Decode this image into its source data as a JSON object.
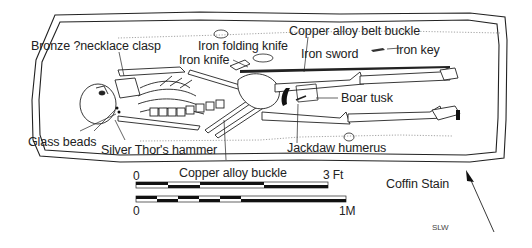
{
  "figure": {
    "type": "archaeological grave plan",
    "signature": "SLW"
  },
  "labels": {
    "bronze_clasp": "Bronze ?necklace clasp",
    "iron_folding_knife": "Iron folding knife",
    "iron_knife": "Iron knife",
    "copper_belt_buckle": "Copper alloy belt buckle",
    "iron_sword": "Iron sword",
    "iron_key": "Iron key",
    "boar_tusk": "Boar tusk",
    "jackdaw_humerus": "Jackdaw humerus",
    "glass_beads": "Glass beads",
    "thors_hammer": "Silver Thor's hammer",
    "copper_buckle": "Copper alloy buckle"
  },
  "legend": {
    "coffin_stain": "Coffin Stain"
  },
  "scale_bars": {
    "feet": {
      "start": "0",
      "end": "3 Ft",
      "segments": 6
    },
    "metric": {
      "start": "0",
      "end": "1M",
      "segments": 6
    }
  },
  "north_arrow": {
    "icon": "north-arrow-icon"
  },
  "colors": {
    "ink": "#222222",
    "stain": "#9a9a9a",
    "paper": "#ffffff"
  }
}
